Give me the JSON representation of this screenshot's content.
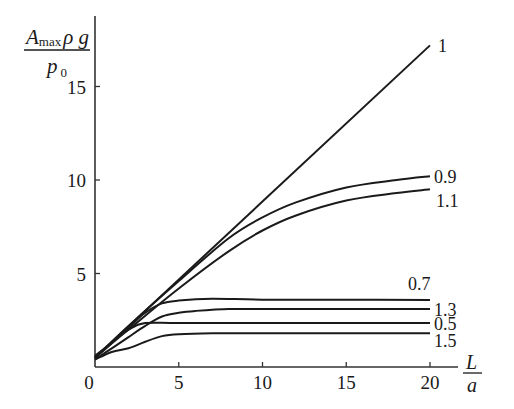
{
  "chart_data": {
    "type": "line",
    "title": "",
    "xlabel": "L/a",
    "ylabel": "A_max ρ g / p_0",
    "xlim": [
      0,
      21
    ],
    "ylim": [
      0,
      18
    ],
    "x_ticks": [
      0,
      5,
      10,
      15,
      20
    ],
    "y_ticks": [
      5,
      10,
      15
    ],
    "grid": false,
    "legend": "inline labels at right end of curves",
    "series": [
      {
        "name": "1",
        "x": [
          0,
          2,
          5,
          10,
          15,
          20
        ],
        "y": [
          0.5,
          2.2,
          4.7,
          8.9,
          13.0,
          17.2
        ]
      },
      {
        "name": "0.9",
        "x": [
          0,
          2,
          5,
          8,
          10,
          12,
          15,
          18,
          20
        ],
        "y": [
          0.5,
          2.2,
          4.6,
          6.9,
          8.0,
          8.8,
          9.6,
          10.0,
          10.2
        ]
      },
      {
        "name": "1.1",
        "x": [
          0,
          2,
          5,
          8,
          10,
          12,
          15,
          18,
          20
        ],
        "y": [
          0.5,
          2.0,
          4.2,
          6.2,
          7.3,
          8.1,
          8.9,
          9.3,
          9.5
        ]
      },
      {
        "name": "0.7",
        "x": [
          0,
          1,
          2,
          3,
          4,
          5,
          7,
          10,
          15,
          20
        ],
        "y": [
          0.5,
          1.3,
          2.1,
          2.9,
          3.4,
          3.55,
          3.65,
          3.6,
          3.6,
          3.58
        ]
      },
      {
        "name": "1.3",
        "x": [
          0,
          1,
          2,
          3,
          4,
          5,
          6,
          8,
          10,
          15,
          20
        ],
        "y": [
          0.4,
          1.0,
          1.6,
          2.2,
          2.7,
          2.9,
          3.0,
          3.1,
          3.1,
          3.1,
          3.1
        ]
      },
      {
        "name": "0.5",
        "x": [
          0,
          1,
          2,
          3,
          5,
          10,
          15,
          20
        ],
        "y": [
          0.6,
          1.3,
          2.0,
          2.35,
          2.35,
          2.35,
          2.35,
          2.35
        ]
      },
      {
        "name": "1.5",
        "x": [
          0,
          1,
          2,
          3,
          4,
          5,
          7,
          10,
          15,
          20
        ],
        "y": [
          0.4,
          0.8,
          1.0,
          1.35,
          1.65,
          1.75,
          1.8,
          1.8,
          1.8,
          1.8
        ]
      }
    ]
  },
  "axes": {
    "x_tick_labels": [
      "0",
      "5",
      "10",
      "15",
      "20"
    ],
    "y_tick_labels": [
      "5",
      "10",
      "15"
    ],
    "xlabel_numerator": "L",
    "xlabel_denominator": "a",
    "ylabel_A": "A",
    "ylabel_sub": "max",
    "ylabel_rest": "ρ g",
    "ylabel_p": "p",
    "ylabel_p_sub": "0"
  },
  "curve_labels": [
    {
      "text": "1",
      "x": 438,
      "y": 52
    },
    {
      "text": "0.9",
      "x": 434,
      "y": 183
    },
    {
      "text": "1.1",
      "x": 436,
      "y": 207
    },
    {
      "text": "0.7",
      "x": 408,
      "y": 290
    },
    {
      "text": "1.3",
      "x": 434,
      "y": 316
    },
    {
      "text": "0.5",
      "x": 434,
      "y": 330
    },
    {
      "text": "1.5",
      "x": 434,
      "y": 347
    }
  ],
  "style": {
    "line_color": "#1a1a1a",
    "background": "#ffffff"
  }
}
